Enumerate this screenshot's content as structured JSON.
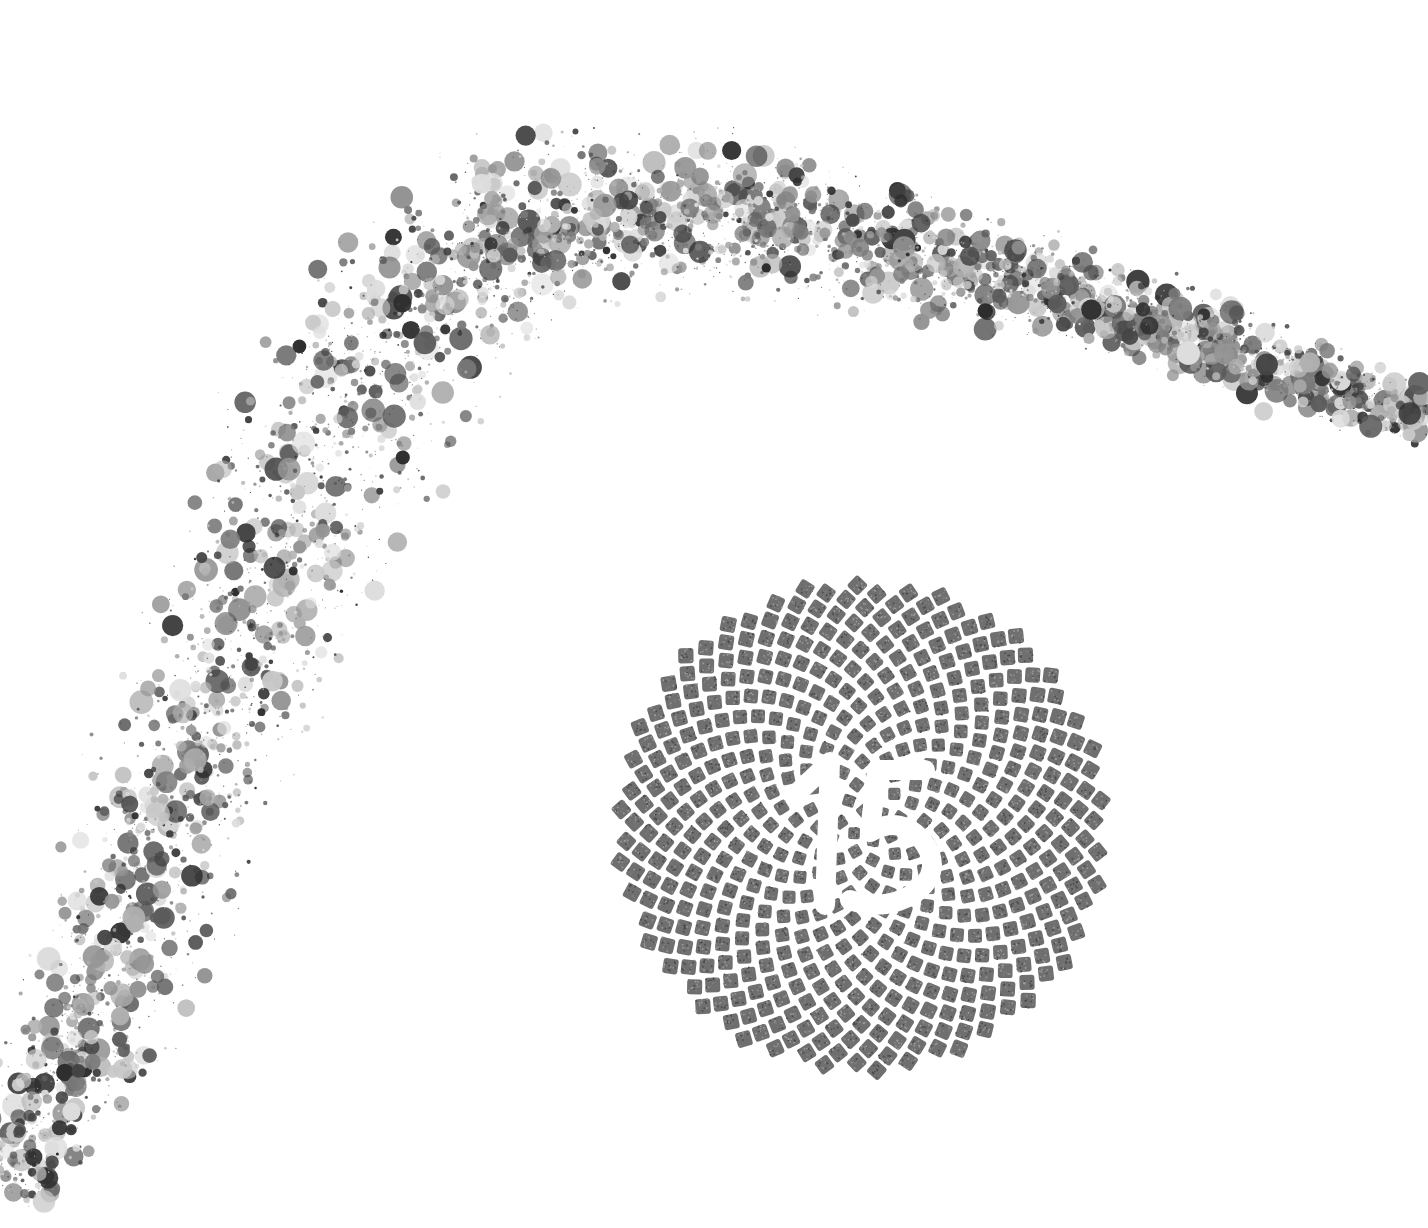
{
  "canvas": {
    "width": 1428,
    "height": 1228,
    "background": "#ffffff"
  },
  "particle_arc": {
    "description": "Grayscale speckled particle stream sweeping from lower-left up across the top to the right edge",
    "path": [
      [
        10,
        1190
      ],
      [
        120,
        960
      ],
      [
        220,
        700
      ],
      [
        330,
        430
      ],
      [
        470,
        250
      ],
      [
        650,
        200
      ],
      [
        850,
        240
      ],
      [
        1050,
        290
      ],
      [
        1230,
        350
      ],
      [
        1428,
        420
      ]
    ],
    "width_profile": [
      120,
      190,
      230,
      250,
      230,
      190,
      150,
      120,
      90,
      60
    ],
    "count": 5200,
    "seed": 15,
    "colors": [
      "#2e2e2e",
      "#444444",
      "#5c5c5c",
      "#7a7a7a",
      "#959595",
      "#b0b0b0",
      "#c8c8c8",
      "#dddddd"
    ],
    "radius_range": [
      0.6,
      12
    ]
  },
  "sunflower_disc": {
    "description": "Phyllotaxis (Fibonacci spiral) arrangement of textured gray rounded tiles",
    "center": [
      862,
      826
    ],
    "outer_radius": 245,
    "tile_count": 520,
    "tile_color": "#6f6f6f",
    "tile_noise_colors": [
      "#4a4a4a",
      "#7d7d7d",
      "#9a9a9a"
    ],
    "gap_color": "#ffffff"
  },
  "numeral": {
    "text": "15",
    "color": "#ffffff",
    "style": "knock-out (negative space) over tile disc"
  }
}
